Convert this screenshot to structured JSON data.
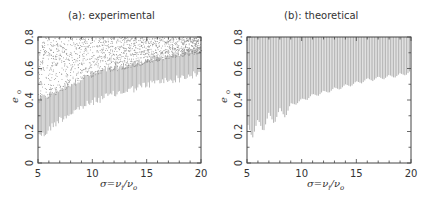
{
  "chart_data": [
    {
      "type": "scatter",
      "title": "(a): experimental",
      "xlabel": "σ=ν_i/ν_o",
      "ylabel": "e_o",
      "xlim": [
        5,
        20
      ],
      "ylim": [
        0,
        0.8
      ],
      "xticks": [
        5,
        10,
        15,
        20
      ],
      "yticks": [
        0,
        0.2,
        0.4,
        0.6,
        0.8
      ],
      "xtick_labels": [
        "5",
        "10",
        "15",
        "20"
      ],
      "ytick_labels": [
        "0",
        "0.2",
        "0.4",
        "0.6",
        "0.8"
      ],
      "grid": false,
      "fill_color": "#9a9a9a",
      "lower_boundary": {
        "x": [
          5,
          5.5,
          6,
          7,
          8,
          9,
          10,
          11,
          12,
          13,
          14,
          15,
          16,
          17,
          18,
          19,
          20
        ],
        "y": [
          0.22,
          0.2,
          0.24,
          0.3,
          0.34,
          0.38,
          0.41,
          0.44,
          0.46,
          0.48,
          0.5,
          0.52,
          0.54,
          0.55,
          0.56,
          0.58,
          0.59
        ]
      },
      "dense_upper": {
        "x": [
          5,
          7,
          10,
          13,
          16,
          20
        ],
        "y": [
          0.38,
          0.45,
          0.55,
          0.6,
          0.65,
          0.7
        ]
      },
      "sparse_upper": 0.8
    },
    {
      "type": "area",
      "title": "(b): theoretical",
      "xlabel": "σ=ν_i/ν_o",
      "ylabel": "e_o",
      "xlim": [
        5,
        20
      ],
      "ylim": [
        0,
        0.8
      ],
      "xticks": [
        5,
        10,
        15,
        20
      ],
      "yticks": [
        0,
        0.2,
        0.4,
        0.6,
        0.8
      ],
      "xtick_labels": [
        "5",
        "10",
        "15",
        "20"
      ],
      "ytick_labels": [
        "0",
        "0.2",
        "0.4",
        "0.6",
        "0.8"
      ],
      "grid": false,
      "fill_color": "#a8a8a8",
      "lower_boundary": {
        "x": [
          5,
          5.5,
          6,
          6.5,
          7,
          7.5,
          8,
          8.5,
          9,
          10,
          11,
          12,
          13,
          14,
          15,
          16,
          17,
          18,
          19,
          20
        ],
        "y": [
          0.26,
          0.18,
          0.28,
          0.22,
          0.32,
          0.27,
          0.35,
          0.31,
          0.38,
          0.41,
          0.44,
          0.46,
          0.48,
          0.5,
          0.52,
          0.54,
          0.55,
          0.56,
          0.57,
          0.59
        ]
      },
      "upper_boundary": 0.8
    }
  ]
}
